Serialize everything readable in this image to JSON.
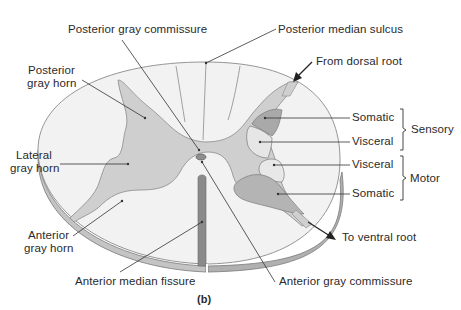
{
  "figure": {
    "caption": "(b)",
    "colors": {
      "background": "#ffffff",
      "white_matter": "#f1f1f1",
      "gray_matter": "#cfcfcf",
      "somatic_sensory": "#a9a9a9",
      "visceral": "#e4e4e4",
      "somatic_motor": "#b4b4b4",
      "rim": "#bdbdbd",
      "fissure": "#8a8a8a",
      "outline": "#7a7a7a",
      "leader_line": "#333333",
      "text": "#2a2a2a"
    }
  },
  "labels": {
    "posterior_gray_commissure": "Posterior gray commissure",
    "posterior_median_sulcus": "Posterior median sulcus",
    "from_dorsal_root": "From dorsal root",
    "posterior_gray_horn_1": "Posterior",
    "posterior_gray_horn_2": "gray horn",
    "lateral_gray_horn_1": "Lateral",
    "lateral_gray_horn_2": "gray horn",
    "anterior_gray_horn_1": "Anterior",
    "anterior_gray_horn_2": "gray horn",
    "sensory_somatic": "Somatic",
    "sensory_visceral": "Visceral",
    "motor_visceral": "Visceral",
    "motor_somatic": "Somatic",
    "sensory_group": "Sensory",
    "motor_group": "Motor",
    "to_ventral_root": "To ventral root",
    "anterior_median_fissure": "Anterior median fissure",
    "anterior_gray_commissure": "Anterior gray commissure"
  }
}
